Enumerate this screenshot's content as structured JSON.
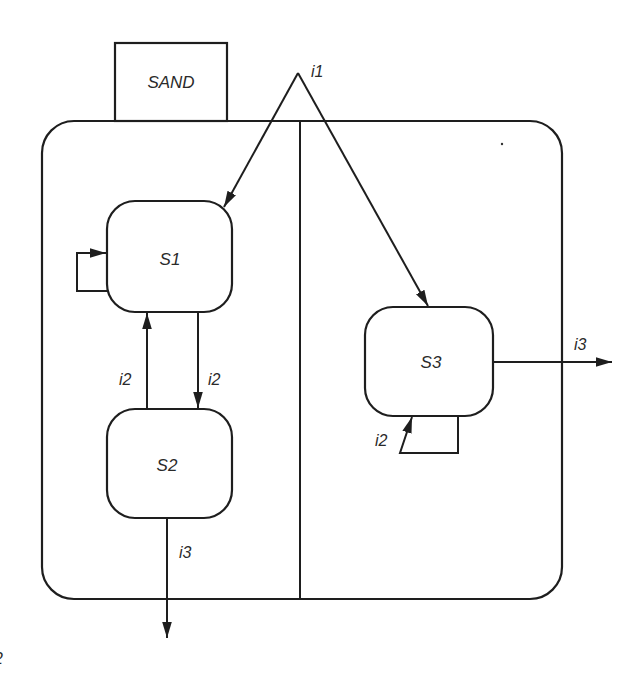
{
  "diagram": {
    "type": "statechart",
    "superstate": {
      "label": "SAND",
      "decomposition": "AND (orthogonal regions)",
      "regions": 2
    },
    "states": [
      {
        "id": "S1",
        "label": "S1",
        "region": "left"
      },
      {
        "id": "S2",
        "label": "S2",
        "region": "left"
      },
      {
        "id": "S3",
        "label": "S3",
        "region": "right"
      }
    ],
    "transitions": [
      {
        "from": "external",
        "to": "S1",
        "label": "i1"
      },
      {
        "from": "external",
        "to": "S3",
        "label": "i1"
      },
      {
        "from": "S1",
        "to": "S1",
        "label": ""
      },
      {
        "from": "S1",
        "to": "S2",
        "label": "i2"
      },
      {
        "from": "S2",
        "to": "S1",
        "label": "i2"
      },
      {
        "from": "S2",
        "to": "exit",
        "label": "i3"
      },
      {
        "from": "S3",
        "to": "S3",
        "label": "i2"
      },
      {
        "from": "S3",
        "to": "exit",
        "label": "i3"
      }
    ],
    "labels": {
      "sand": "SAND",
      "i1": "i1",
      "s1": "S1",
      "s2": "S2",
      "s3": "S3",
      "s2_to_s1": "i2",
      "s1_to_s2": "i2",
      "s2_exit": "i3",
      "s3_exit": "i3",
      "s3_self": "i2"
    },
    "colors": {
      "stroke": "#1e1e1e",
      "text": "#2a2a2a",
      "background": "#ffffff"
    }
  }
}
